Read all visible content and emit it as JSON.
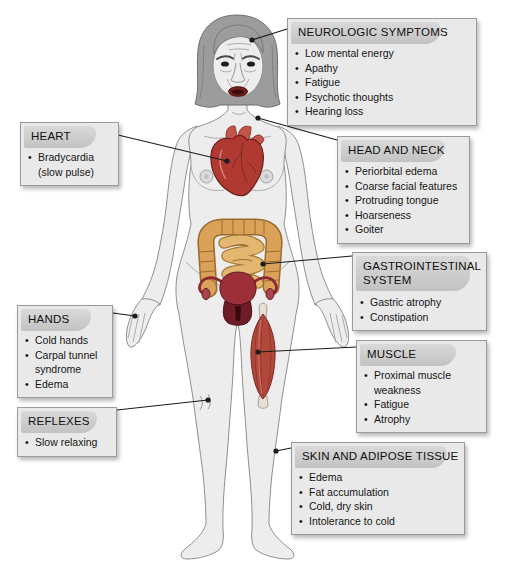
{
  "boxes": {
    "neurologic": {
      "title": "NEUROLOGIC SYMPTOMS",
      "items": [
        "Low mental energy",
        "Apathy",
        "Fatigue",
        "Psychotic thoughts",
        "Hearing loss"
      ]
    },
    "heart": {
      "title": "HEART",
      "items": [
        "Bradycardia (slow pulse)"
      ]
    },
    "head_neck": {
      "title": "HEAD AND NECK",
      "items": [
        "Periorbital edema",
        "Coarse facial features",
        "Protruding tongue",
        "Hoarseness",
        "Goiter"
      ]
    },
    "gastrointestinal": {
      "title": "GASTROINTESTINAL SYSTEM",
      "items": [
        "Gastric atrophy",
        "Constipation"
      ]
    },
    "hands": {
      "title": "HANDS",
      "items": [
        "Cold hands",
        "Carpal tunnel syndrome",
        "Edema"
      ]
    },
    "muscle": {
      "title": "MUSCLE",
      "items": [
        "Proximal muscle weakness",
        "Fatigue",
        "Atrophy"
      ]
    },
    "reflexes": {
      "title": "REFLEXES",
      "items": [
        "Slow relaxing"
      ]
    },
    "skin": {
      "title": "SKIN AND ADIPOSE TISSUE",
      "items": [
        "Edema",
        "Fat accumulation",
        "Cold, dry skin",
        "Intolerance to cold"
      ]
    }
  },
  "colors": {
    "box_bg": "#e9e9e9",
    "box_border": "#9a9a9a",
    "title_band": "#c9c9c9",
    "text": "#151515",
    "body_fill": "#ededed",
    "body_stroke": "#8f8f8f",
    "hair": "#9c9c9c",
    "heart_red": "#b03a32",
    "intestine_tan": "#d9a258",
    "uterus_maroon": "#9c2f38",
    "muscle_red": "#b2473b",
    "leader_line": "#1c1c1c"
  }
}
